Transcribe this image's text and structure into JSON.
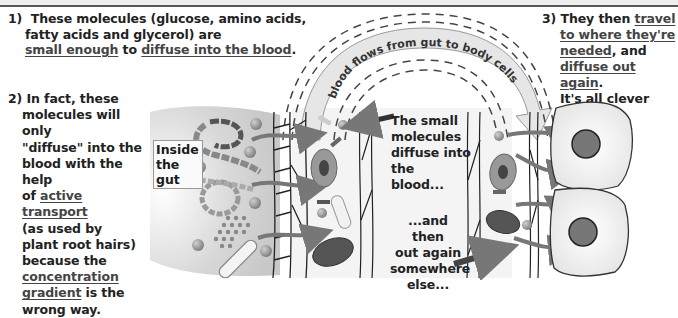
{
  "note1": {
    "number": "1)",
    "line1": "These molecules (glucose, amino acids,",
    "line2": "fatty acids and glycerol) are",
    "u1": "small enough",
    "mid": " to ",
    "u2": "diffuse into the blood",
    "end": "."
  },
  "note2": {
    "number": "2)",
    "l1": "In fact, these",
    "l2": "molecules will only",
    "l3": "\"diffuse\" into the",
    "l4": "blood with the help",
    "l5a": "of ",
    "l5u": "active transport",
    "l6": "(as used by",
    "l7": "plant root hairs)",
    "l8": "because the",
    "l9u": "concentration",
    "l10u": "gradient",
    "l10": " is the",
    "l11": "wrong way."
  },
  "note3": {
    "number": "3)",
    "l1a": "They then ",
    "l1u": "travel",
    "l2u": "to where they're",
    "l3u": "needed",
    "l3": ", and",
    "l4u": "diffuse out again",
    "l4": ".",
    "l5": "It's all clever stuff."
  },
  "arc_label": "blood flows from gut to body cells",
  "gut_label": "Inside the gut",
  "mid_labels": {
    "into": [
      "The small",
      "molecules",
      "diffuse into",
      "the blood..."
    ],
    "out": [
      "...and then",
      "out again",
      "somewhere",
      "else..."
    ]
  },
  "colors": {
    "text": "#222222",
    "arrow": "#777777",
    "arc_fill": "#e6e6e6",
    "cell_nucleus": "#666666"
  }
}
